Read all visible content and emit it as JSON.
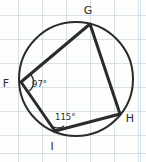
{
  "figure": {
    "kind": "cyclic-quadrilateral-inscribed-in-circle",
    "background_color": "#fdfdfb",
    "grid_color": "#aac3d2",
    "stroke_color": "#2b2b2b",
    "circle": {
      "center_x": 76,
      "center_y": 79,
      "radius": 57,
      "stroke_width": 2
    },
    "polygon": {
      "stroke_width": 3,
      "points": "90,24 120,114 55,131 21,82"
    },
    "vertices": [
      {
        "id": "G",
        "label": "G",
        "x": 90,
        "y": 24,
        "label_x": 88,
        "label_y": 14
      },
      {
        "id": "H",
        "label": "H",
        "x": 120,
        "y": 114,
        "label_x": 130,
        "label_y": 122
      },
      {
        "id": "I",
        "label": "I",
        "x": 55,
        "y": 131,
        "label_x": 52,
        "label_y": 150
      },
      {
        "id": "F",
        "label": "F",
        "x": 21,
        "y": 82,
        "label_x": 6,
        "label_y": 87
      }
    ],
    "angles": [
      {
        "at_vertex": "F",
        "label": "97°",
        "value": 97,
        "label_x": 32,
        "label_y": 87,
        "arc_path": "M 30 74 A 11 11 0 0 1 29 91"
      },
      {
        "at_vertex": "I",
        "label": "115°",
        "value": 115,
        "label_x": 55,
        "label_y": 120,
        "arc_path": "M 48 122 A 11 11 0 0 0 64 126"
      }
    ]
  }
}
